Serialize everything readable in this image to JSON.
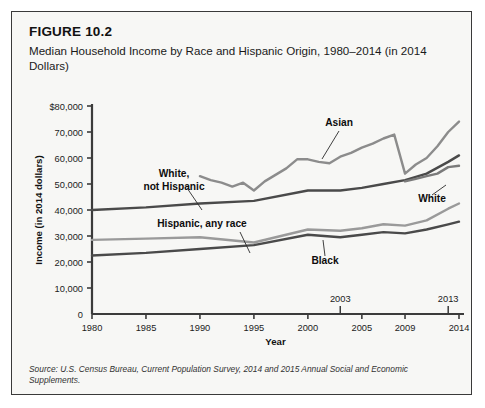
{
  "figure": {
    "number": "FIGURE 10.2",
    "title": "Median Household Income by Race and Hispanic Origin, 1980–2014 (in 2014 Dollars)",
    "source": "Source: U.S. Census Bureau, Current Population Survey, 2014 and 2015 Annual Social and Economic Supplements."
  },
  "chart_data": {
    "type": "line",
    "title": "Median Household Income by Race and Hispanic Origin, 1980–2014 (in 2014 Dollars)",
    "xlabel": "Year",
    "ylabel": "Income (in 2014 dollars)",
    "xlim": [
      1980,
      2014
    ],
    "ylim": [
      0,
      80000
    ],
    "grid": false,
    "legend": "inline-labels",
    "ytick_labels": [
      "$80,000",
      "70,000",
      "60,000",
      "50,000",
      "40,000",
      "30,000",
      "20,000",
      "10,000",
      "0"
    ],
    "yticks": [
      80000,
      70000,
      60000,
      50000,
      40000,
      30000,
      20000,
      10000,
      0
    ],
    "xtick_labels": [
      "1980",
      "1985",
      "1990",
      "1995",
      "2000",
      "2005",
      "2009",
      "2014"
    ],
    "xticks": [
      1980,
      1985,
      1990,
      1995,
      2000,
      2005,
      2009,
      2014
    ],
    "annotations": [
      {
        "label": "2003",
        "x": 2003,
        "position": "above-axis"
      },
      {
        "label": "2013",
        "x": 2013,
        "position": "above-axis"
      }
    ],
    "series": [
      {
        "name": "Asian",
        "color": "#8c8c8c",
        "label_text": "Asian",
        "x": [
          1990,
          1991,
          1992,
          1993,
          1994,
          1995,
          1996,
          1997,
          1998,
          1999,
          2000,
          2001,
          2002,
          2003,
          2004,
          2005,
          2006,
          2007,
          2008,
          2009,
          2010,
          2011,
          2012,
          2013,
          2014
        ],
        "values": [
          53000,
          51500,
          50500,
          49000,
          50500,
          47500,
          51000,
          53500,
          56000,
          59500,
          59500,
          58500,
          58000,
          60500,
          62000,
          64000,
          65500,
          67500,
          69000,
          54000,
          57500,
          60000,
          64500,
          70000,
          74000
        ]
      },
      {
        "name": "White, not Hispanic",
        "color": "#4a4a4a",
        "label_text": "White,\nnot Hispanic",
        "x": [
          1980,
          1985,
          1990,
          1995,
          2000,
          2003,
          2005,
          2007,
          2009,
          2011,
          2013,
          2014
        ],
        "values": [
          40000,
          41000,
          42500,
          43500,
          47500,
          47500,
          48500,
          50000,
          51500,
          54000,
          58500,
          61000
        ]
      },
      {
        "name": "White",
        "color": "#7a7a7a",
        "label_text": "White",
        "x": [
          2009,
          2010,
          2011,
          2012,
          2013,
          2014
        ],
        "values": [
          51000,
          52000,
          53000,
          54000,
          56500,
          57000
        ]
      },
      {
        "name": "Hispanic, any race",
        "color": "#9a9a9a",
        "label_text": "Hispanic, any race",
        "x": [
          1980,
          1985,
          1990,
          1995,
          2000,
          2003,
          2005,
          2007,
          2009,
          2011,
          2013,
          2014
        ],
        "values": [
          28500,
          29000,
          29500,
          27500,
          32500,
          32000,
          33000,
          34500,
          34000,
          36000,
          40500,
          42500
        ]
      },
      {
        "name": "Black",
        "color": "#4a4a4a",
        "label_text": "Black",
        "x": [
          1980,
          1985,
          1990,
          1995,
          2000,
          2003,
          2005,
          2007,
          2009,
          2011,
          2013,
          2014
        ],
        "values": [
          22500,
          23500,
          25000,
          26500,
          30500,
          29500,
          30500,
          31500,
          31000,
          32500,
          34500,
          35500
        ]
      }
    ]
  }
}
